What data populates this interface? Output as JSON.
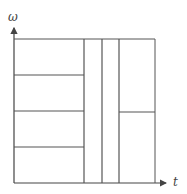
{
  "diagram": {
    "type": "time-frequency tiling",
    "y_axis_label": "ω",
    "x_axis_label": "t",
    "columns": [
      {
        "name": "left",
        "time_width_fraction": 0.49,
        "frequency_bands": 4
      },
      {
        "name": "narrow-1",
        "time_width_fraction": 0.13,
        "frequency_bands": 1
      },
      {
        "name": "narrow-2",
        "time_width_fraction": 0.13,
        "frequency_bands": 1
      },
      {
        "name": "right",
        "time_width_fraction": 0.25,
        "frequency_bands": 2
      }
    ],
    "line_color": "#555555"
  }
}
